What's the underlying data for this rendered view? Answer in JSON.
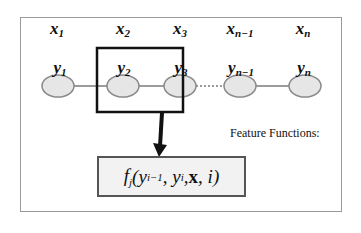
{
  "diagram": {
    "type": "linear-chain CRF",
    "observations": [
      {
        "base": "x",
        "sub": "1"
      },
      {
        "base": "x",
        "sub": "2"
      },
      {
        "base": "x",
        "sub": "3"
      },
      {
        "base": "x",
        "sub": "n−1"
      },
      {
        "base": "x",
        "sub": "n"
      }
    ],
    "labels": [
      {
        "base": "y",
        "sub": "1"
      },
      {
        "base": "y",
        "sub": "2"
      },
      {
        "base": "y",
        "sub": "3"
      },
      {
        "base": "y",
        "sub": "n−1"
      },
      {
        "base": "y",
        "sub": "n"
      }
    ],
    "feature_label": "Feature Functions:",
    "feature_function": {
      "name": "f",
      "name_sub": "j",
      "args_open": "(y",
      "arg1_sub": "i−1",
      "mid1": ", y",
      "arg2_sub": "i",
      "mid2": ", ",
      "bold_x": "x",
      "tail": ", i)"
    },
    "colors": {
      "node_fill": "#e6e6e6",
      "node_stroke": "#8a8a8a",
      "edge": "#7a7a7a",
      "context_box": "#111111",
      "func_box_border": "#555555",
      "func_box_fill": "#f2f2f2",
      "frame": "#9a9a9a"
    }
  }
}
